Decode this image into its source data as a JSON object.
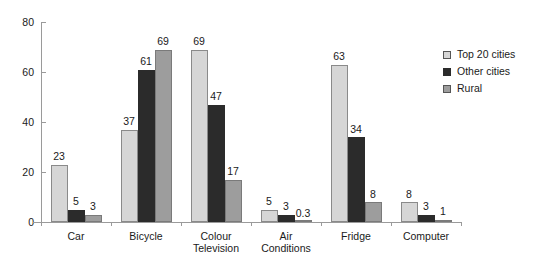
{
  "chart_data": {
    "type": "bar",
    "title": "",
    "subtitle": "",
    "xlabel": "",
    "ylabel": "",
    "ylim": [
      0,
      80
    ],
    "yticks": [
      0,
      20,
      40,
      60,
      80
    ],
    "grid": false,
    "legend_position": "right",
    "categories": [
      "Car",
      "Bicycle",
      "Colour Television",
      "Air Conditions",
      "Fridge",
      "Computer"
    ],
    "category_lines": [
      [
        "Car"
      ],
      [
        "Bicycle"
      ],
      [
        "Colour",
        "Television"
      ],
      [
        "Air",
        "Conditions"
      ],
      [
        "Fridge"
      ],
      [
        "Computer"
      ]
    ],
    "series": [
      {
        "name": "Top 20 cities",
        "color": "#d6d6d6",
        "values": [
          23,
          37,
          69,
          5,
          63,
          8
        ],
        "labels": [
          "23",
          "37",
          "69",
          "5",
          "63",
          "8"
        ]
      },
      {
        "name": "Other cities",
        "color": "#2b2b2b",
        "values": [
          5,
          61,
          47,
          3,
          34,
          3
        ],
        "labels": [
          "5",
          "61",
          "47",
          "3",
          "34",
          "3"
        ]
      },
      {
        "name": "Rural",
        "color": "#9d9d9d",
        "values": [
          3,
          69,
          17,
          0.3,
          8,
          1
        ],
        "labels": [
          "3",
          "69",
          "17",
          "0.3",
          "8",
          "1"
        ]
      }
    ]
  },
  "axis": {
    "color": "#9a9a9a"
  }
}
